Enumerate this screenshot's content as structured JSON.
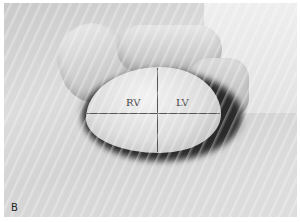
{
  "figure": {
    "panel_label": "B",
    "labels": {
      "right_ventricle": "RV",
      "left_ventricle": "LV"
    }
  }
}
